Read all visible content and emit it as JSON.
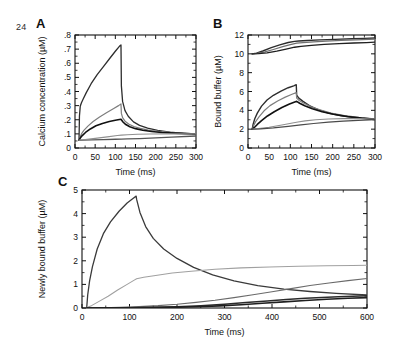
{
  "page": {
    "number": "24"
  },
  "panels": [
    {
      "id": "A",
      "label": "A",
      "xlabel": "Time (ms)",
      "ylabel": "Calcium concentration (µM)"
    },
    {
      "id": "B",
      "label": "B",
      "xlabel": "Time (ms)",
      "ylabel": "Bound buffer (µM)"
    },
    {
      "id": "C",
      "label": "C",
      "xlabel": "Time (ms)",
      "ylabel": "Newly bound buffer (µM)"
    }
  ],
  "colors": {
    "dark": "#2d2d2d",
    "black": "#111111",
    "gray": "#7d7d7d",
    "light_gray": "#a6a6a6",
    "axis": "#111111"
  },
  "chart_data": [
    {
      "type": "line",
      "panel": "A",
      "title": "A",
      "xlabel": "Time (ms)",
      "ylabel": "Calcium concentration (µM)",
      "xlim": [
        0,
        300
      ],
      "ylim": [
        0,
        0.8
      ],
      "xticks": [
        0,
        50,
        100,
        150,
        200,
        250,
        300
      ],
      "xticklabels": [
        "0",
        "50",
        "100",
        "150",
        "200",
        "250",
        "300"
      ],
      "yticks": [
        0,
        0.1,
        0.2,
        0.3,
        0.4,
        0.5,
        0.6,
        0.7,
        0.8
      ],
      "yticklabels": [
        "0",
        ".1",
        ".2",
        ".3",
        ".4",
        ".5",
        ".6",
        ".7",
        ".8"
      ],
      "grid": false,
      "legend": "none",
      "series": [
        {
          "name": "curve-1-dark",
          "color": "#2d2d2d",
          "width": 1.3,
          "x": [
            10,
            11,
            13,
            16,
            20,
            28,
            40,
            55,
            70,
            85,
            100,
            110,
            114,
            115,
            118,
            124,
            132,
            145,
            160,
            180,
            205,
            235,
            265,
            300
          ],
          "y": [
            0.055,
            0.225,
            0.295,
            0.32,
            0.345,
            0.392,
            0.455,
            0.52,
            0.575,
            0.63,
            0.685,
            0.72,
            0.73,
            0.44,
            0.33,
            0.265,
            0.225,
            0.185,
            0.16,
            0.14,
            0.125,
            0.113,
            0.106,
            0.1
          ]
        },
        {
          "name": "curve-2-gray",
          "color": "#7d7d7d",
          "width": 1.2,
          "x": [
            10,
            12,
            16,
            22,
            32,
            45,
            60,
            78,
            95,
            108,
            114,
            115,
            118,
            124,
            133,
            146,
            162,
            182,
            208,
            238,
            268,
            300
          ],
          "y": [
            0.055,
            0.075,
            0.1,
            0.125,
            0.155,
            0.188,
            0.218,
            0.25,
            0.278,
            0.3,
            0.312,
            0.245,
            0.215,
            0.19,
            0.17,
            0.152,
            0.139,
            0.127,
            0.118,
            0.11,
            0.104,
            0.1
          ]
        },
        {
          "name": "curve-3-black",
          "color": "#111111",
          "width": 1.6,
          "x": [
            10,
            13,
            18,
            26,
            38,
            52,
            68,
            85,
            100,
            110,
            114,
            115,
            119,
            126,
            136,
            150,
            168,
            190,
            215,
            245,
            272,
            300
          ],
          "y": [
            0.055,
            0.07,
            0.088,
            0.11,
            0.135,
            0.157,
            0.174,
            0.188,
            0.197,
            0.202,
            0.204,
            0.2,
            0.184,
            0.166,
            0.15,
            0.137,
            0.126,
            0.117,
            0.11,
            0.105,
            0.102,
            0.099
          ]
        },
        {
          "name": "curve-4-low",
          "color": "#555555",
          "width": 1.3,
          "x": [
            10,
            20,
            40,
            70,
            100,
            115,
            130,
            160,
            200,
            240,
            300
          ],
          "y": [
            0.055,
            0.056,
            0.058,
            0.06,
            0.062,
            0.063,
            0.064,
            0.067,
            0.072,
            0.077,
            0.085
          ]
        },
        {
          "name": "curve-5-low-gray",
          "color": "#8f8f8f",
          "width": 1.1,
          "x": [
            10,
            25,
            50,
            80,
            105,
            115,
            130,
            155,
            185,
            220,
            260,
            300
          ],
          "y": [
            0.055,
            0.06,
            0.068,
            0.079,
            0.088,
            0.091,
            0.094,
            0.097,
            0.099,
            0.1,
            0.1,
            0.1
          ]
        }
      ]
    },
    {
      "type": "line",
      "panel": "B",
      "title": "B",
      "xlabel": "Time (ms)",
      "ylabel": "Bound buffer (µM)",
      "xlim": [
        0,
        300
      ],
      "ylim": [
        0,
        12
      ],
      "xticks": [
        0,
        50,
        100,
        150,
        200,
        250,
        300
      ],
      "xticklabels": [
        "0",
        "50",
        "100",
        "150",
        "200",
        "250",
        "300"
      ],
      "yticks": [
        0,
        2,
        4,
        6,
        8,
        10,
        12
      ],
      "yticklabels": [
        "0",
        "2",
        "4",
        "6",
        "8",
        "10",
        "12"
      ],
      "grid": false,
      "legend": "none",
      "series": [
        {
          "name": "upper-curve-1",
          "color": "#2d2d2d",
          "width": 1.4,
          "x": [
            10,
            20,
            35,
            55,
            75,
            95,
            110,
            120,
            140,
            170,
            205,
            245,
            275,
            300
          ],
          "y": [
            10.0,
            10.08,
            10.3,
            10.65,
            10.95,
            11.2,
            11.32,
            11.36,
            11.42,
            11.48,
            11.54,
            11.6,
            11.64,
            11.68
          ]
        },
        {
          "name": "upper-curve-2",
          "color": "#6f6f6f",
          "width": 1.2,
          "x": [
            10,
            22,
            40,
            60,
            82,
            100,
            115,
            130,
            155,
            185,
            220,
            255,
            285,
            300
          ],
          "y": [
            10.0,
            10.05,
            10.2,
            10.46,
            10.76,
            10.98,
            11.14,
            11.2,
            11.28,
            11.35,
            11.42,
            11.48,
            11.53,
            11.56
          ]
        },
        {
          "name": "upper-curve-3",
          "color": "#1f1f1f",
          "width": 1.3,
          "x": [
            10,
            25,
            45,
            68,
            90,
            110,
            125,
            150,
            180,
            215,
            250,
            280,
            300
          ],
          "y": [
            10.0,
            10.02,
            10.1,
            10.28,
            10.5,
            10.7,
            10.8,
            10.9,
            11.0,
            11.08,
            11.15,
            11.2,
            11.24
          ]
        },
        {
          "name": "lower-curve-1",
          "color": "#2d2d2d",
          "width": 1.4,
          "x": [
            10,
            12,
            16,
            22,
            32,
            45,
            60,
            78,
            95,
            108,
            114,
            115,
            120,
            130,
            145,
            165,
            190,
            220,
            255,
            285,
            300
          ],
          "y": [
            2.0,
            2.5,
            3.1,
            3.7,
            4.45,
            5.1,
            5.6,
            6.05,
            6.4,
            6.6,
            6.72,
            5.6,
            5.3,
            4.95,
            4.5,
            4.08,
            3.72,
            3.42,
            3.2,
            3.08,
            3.02
          ]
        },
        {
          "name": "lower-curve-2",
          "color": "#7d7d7d",
          "width": 1.2,
          "x": [
            10,
            13,
            18,
            26,
            38,
            52,
            70,
            88,
            104,
            114,
            115,
            121,
            132,
            148,
            170,
            196,
            228,
            262,
            292,
            300
          ],
          "y": [
            2.0,
            2.35,
            2.8,
            3.3,
            3.95,
            4.5,
            5.0,
            5.4,
            5.7,
            5.88,
            5.3,
            5.05,
            4.75,
            4.4,
            4.05,
            3.72,
            3.45,
            3.25,
            3.12,
            3.08
          ]
        },
        {
          "name": "lower-curve-3",
          "color": "#111111",
          "width": 1.6,
          "x": [
            10,
            15,
            22,
            32,
            46,
            62,
            80,
            98,
            112,
            115,
            122,
            134,
            152,
            175,
            202,
            235,
            268,
            300
          ],
          "y": [
            2.0,
            2.18,
            2.5,
            2.9,
            3.4,
            3.85,
            4.3,
            4.68,
            4.92,
            4.95,
            4.75,
            4.48,
            4.16,
            3.85,
            3.58,
            3.35,
            3.18,
            3.05
          ]
        },
        {
          "name": "lower-curve-4-flat",
          "color": "#8f8f8f",
          "width": 1.1,
          "x": [
            10,
            25,
            50,
            80,
            105,
            118,
            135,
            160,
            190,
            225,
            262,
            300
          ],
          "y": [
            2.0,
            2.06,
            2.2,
            2.44,
            2.66,
            2.76,
            2.88,
            3.0,
            3.08,
            3.12,
            3.12,
            3.08
          ]
        },
        {
          "name": "lower-curve-5-flat",
          "color": "#4a4a4a",
          "width": 1.2,
          "x": [
            10,
            30,
            60,
            95,
            125,
            155,
            190,
            225,
            260,
            300
          ],
          "y": [
            2.0,
            2.04,
            2.14,
            2.3,
            2.45,
            2.6,
            2.74,
            2.85,
            2.94,
            3.0
          ]
        }
      ]
    },
    {
      "type": "line",
      "panel": "C",
      "title": "C",
      "xlabel": "Time (ms)",
      "ylabel": "Newly bound buffer (µM)",
      "xlim": [
        0,
        600
      ],
      "ylim": [
        0,
        5
      ],
      "xticks": [
        0,
        100,
        200,
        300,
        400,
        500,
        600
      ],
      "xticklabels": [
        "0",
        "100",
        "200",
        "300",
        "400",
        "500",
        "600"
      ],
      "yticks": [
        0,
        1,
        2,
        3,
        4,
        5
      ],
      "yticklabels": [
        "0",
        "1",
        "2",
        "3",
        "4",
        "5"
      ],
      "grid": false,
      "legend": "none",
      "series": [
        {
          "name": "peak-curve-dark",
          "color": "#3a3a3a",
          "width": 1.3,
          "x": [
            10,
            12,
            16,
            22,
            32,
            45,
            60,
            78,
            95,
            108,
            114,
            115,
            122,
            134,
            150,
            172,
            200,
            235,
            275,
            320,
            370,
            425,
            480,
            535,
            600
          ],
          "y": [
            0.04,
            0.55,
            1.15,
            1.75,
            2.5,
            3.15,
            3.65,
            4.1,
            4.45,
            4.65,
            4.74,
            4.6,
            4.05,
            3.45,
            2.95,
            2.5,
            2.1,
            1.72,
            1.4,
            1.15,
            0.95,
            0.8,
            0.7,
            0.62,
            0.55
          ]
        },
        {
          "name": "rising-plateau-light",
          "color": "#a0a0a0",
          "width": 1.1,
          "x": [
            10,
            20,
            35,
            55,
            75,
            95,
            110,
            115,
            130,
            155,
            190,
            230,
            280,
            335,
            395,
            455,
            515,
            570,
            600
          ],
          "y": [
            0.02,
            0.1,
            0.27,
            0.5,
            0.76,
            1.0,
            1.18,
            1.24,
            1.3,
            1.38,
            1.48,
            1.56,
            1.64,
            1.7,
            1.74,
            1.77,
            1.79,
            1.8,
            1.81
          ]
        },
        {
          "name": "slow-rise-gray",
          "color": "#6a6a6a",
          "width": 1.1,
          "x": [
            10,
            40,
            80,
            120,
            160,
            200,
            240,
            280,
            320,
            360,
            400,
            440,
            480,
            520,
            560,
            600
          ],
          "y": [
            0.0,
            0.01,
            0.03,
            0.06,
            0.1,
            0.16,
            0.24,
            0.33,
            0.44,
            0.56,
            0.69,
            0.82,
            0.95,
            1.06,
            1.16,
            1.25
          ]
        },
        {
          "name": "low-rise-dark",
          "color": "#2b2b2b",
          "width": 1.5,
          "x": [
            10,
            50,
            100,
            150,
            200,
            250,
            300,
            345,
            390,
            430,
            470,
            505,
            540,
            570,
            600
          ],
          "y": [
            0.0,
            0.005,
            0.015,
            0.03,
            0.055,
            0.1,
            0.16,
            0.23,
            0.3,
            0.36,
            0.41,
            0.45,
            0.48,
            0.5,
            0.52
          ]
        },
        {
          "name": "lowest-flat-dark",
          "color": "#1f1f1f",
          "width": 1.6,
          "x": [
            10,
            60,
            120,
            180,
            240,
            290,
            335,
            380,
            425,
            470,
            515,
            560,
            600
          ],
          "y": [
            0.0,
            0.004,
            0.012,
            0.025,
            0.05,
            0.09,
            0.14,
            0.2,
            0.26,
            0.32,
            0.37,
            0.41,
            0.44
          ]
        }
      ]
    }
  ]
}
